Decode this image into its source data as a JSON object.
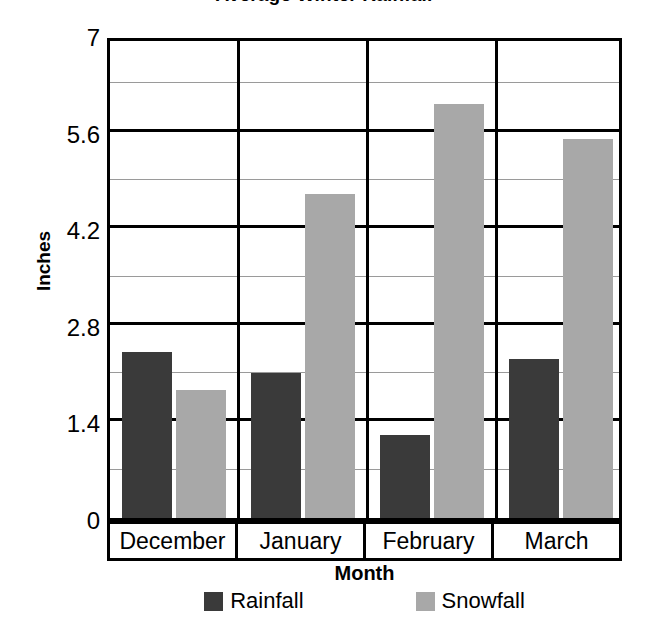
{
  "chart_data": {
    "type": "bar",
    "title": "Average Winter Rainfall",
    "xlabel": "Month",
    "ylabel": "Inches",
    "categories": [
      "December",
      "January",
      "February",
      "March"
    ],
    "series": [
      {
        "name": "Rainfall",
        "color": "#3a3a3a",
        "values": [
          2.4,
          2.1,
          1.2,
          2.3
        ]
      },
      {
        "name": "Snowfall",
        "color": "#a8a8a8",
        "values": [
          1.85,
          4.7,
          6.0,
          5.5
        ]
      }
    ],
    "ylim": [
      0,
      7
    ],
    "ytick_labels": [
      "0",
      "1.4",
      "2.8",
      "4.2",
      "5.6",
      "7"
    ],
    "ytick_values": [
      0,
      1.4,
      2.8,
      4.2,
      5.6,
      7
    ],
    "minor_tick_values": [
      0.7,
      2.1,
      3.5,
      4.9,
      6.3
    ],
    "grid": true,
    "legend_position": "bottom"
  },
  "axis": {
    "y_title": "Inches",
    "x_title": "Month"
  },
  "legend": {
    "items": [
      {
        "label": "Rainfall",
        "color": "#3a3a3a"
      },
      {
        "label": "Snowfall",
        "color": "#a8a8a8"
      }
    ]
  },
  "yticks": [
    {
      "label": "7",
      "value": 7
    },
    {
      "label": "5.6",
      "value": 5.6
    },
    {
      "label": "4.2",
      "value": 4.2
    },
    {
      "label": "2.8",
      "value": 2.8
    },
    {
      "label": "1.4",
      "value": 1.4
    },
    {
      "label": "0",
      "value": 0
    }
  ],
  "categories": [
    {
      "label": "December"
    },
    {
      "label": "January"
    },
    {
      "label": "February"
    },
    {
      "label": "March"
    }
  ]
}
